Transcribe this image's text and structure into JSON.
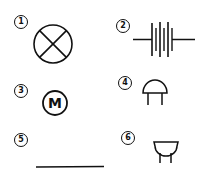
{
  "diagram": {
    "title": "",
    "symbols": [
      {
        "number": "1",
        "label": "1",
        "symbol": "lamp-cross-circle"
      },
      {
        "number": "2",
        "label": "2",
        "symbol": "battery-multi-cell"
      },
      {
        "number": "3",
        "label": "3",
        "symbol": "motor",
        "text": "M"
      },
      {
        "number": "4",
        "label": "4",
        "symbol": "dome-top-terminals"
      },
      {
        "number": "5",
        "label": "5",
        "symbol": "conductor-wire"
      },
      {
        "number": "6",
        "label": "6",
        "symbol": "bowl-bottom-terminals"
      }
    ],
    "colors": {
      "stroke": "#111111",
      "background": "#ffffff"
    }
  }
}
